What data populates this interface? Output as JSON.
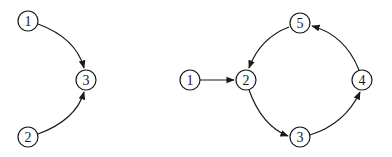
{
  "graphs": [
    {
      "name": "left-graph",
      "nodes": [
        {
          "id": "1",
          "label": "1"
        },
        {
          "id": "3",
          "label": "3"
        },
        {
          "id": "2",
          "label": "2"
        }
      ],
      "edges": [
        {
          "from": "1",
          "to": "3"
        },
        {
          "from": "2",
          "to": "3"
        }
      ]
    },
    {
      "name": "right-graph",
      "nodes": [
        {
          "id": "1",
          "label": "1"
        },
        {
          "id": "2",
          "label": "2"
        },
        {
          "id": "5",
          "label": "5"
        },
        {
          "id": "4",
          "label": "4"
        },
        {
          "id": "3",
          "label": "3"
        }
      ],
      "edges": [
        {
          "from": "1",
          "to": "2"
        },
        {
          "from": "2",
          "to": "3"
        },
        {
          "from": "3",
          "to": "4"
        },
        {
          "from": "4",
          "to": "5"
        },
        {
          "from": "5",
          "to": "2"
        }
      ]
    }
  ]
}
